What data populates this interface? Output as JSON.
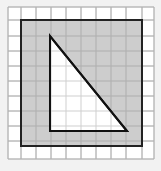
{
  "diagram": {
    "grid": {
      "columns": 10,
      "rows": 10
    },
    "outer_square": {
      "fill": "#c4c4c4",
      "stroke": "#222222",
      "cells": [
        1,
        1,
        9,
        9
      ]
    },
    "triangle": {
      "fill": "#ffffff",
      "stroke": "#111111",
      "vertices_cells": [
        [
          3,
          2
        ],
        [
          3,
          8
        ],
        [
          8,
          8
        ]
      ]
    },
    "colors": {
      "background": "#f2f2f2",
      "grid_bg": "#ffffff",
      "grid_line": "#cfcfcf"
    }
  }
}
